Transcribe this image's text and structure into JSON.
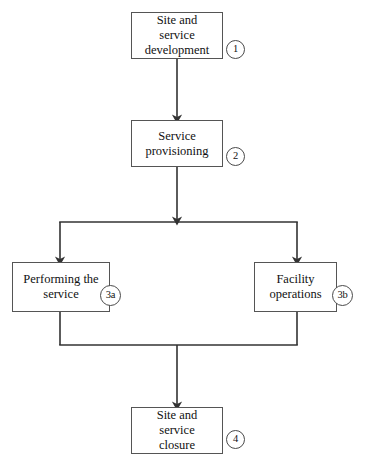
{
  "diagram": {
    "background_color": "#ffffff",
    "line_color": "#333333",
    "box_border_color": "#555555",
    "nodes": [
      {
        "id": "site-and-service-development",
        "label": "Site and\nservice\ndevelopment",
        "marker": "1",
        "x": 131,
        "y": 12,
        "width": 92,
        "height": 47,
        "marker_x": 226,
        "marker_y": 40,
        "marker_size": 19
      },
      {
        "id": "service-provisioning",
        "label": "Service\nprovisioning",
        "marker": "2",
        "x": 131,
        "y": 120,
        "width": 92,
        "height": 47,
        "marker_x": 226,
        "marker_y": 147,
        "marker_size": 19
      },
      {
        "id": "performing-the-service",
        "label": "Performing the\nservice",
        "marker": "3a",
        "x": 12,
        "y": 262,
        "width": 98,
        "height": 50,
        "marker_x": 100,
        "marker_y": 285,
        "marker_size": 21
      },
      {
        "id": "facility-operations",
        "label": "Facility\noperations",
        "marker": "3b",
        "x": 254,
        "y": 262,
        "width": 83,
        "height": 50,
        "marker_x": 332,
        "marker_y": 285,
        "marker_size": 21
      },
      {
        "id": "site-and-service-closure",
        "label": "Site and\nservice\nclosure",
        "marker": "4",
        "x": 131,
        "y": 407,
        "width": 92,
        "height": 47,
        "marker_x": 226,
        "marker_y": 430,
        "marker_size": 19
      }
    ],
    "connectors": [
      {
        "id": "dev-to-provisioning",
        "type": "vertical-arrow",
        "x": 177,
        "y1": 59,
        "y2": 120
      },
      {
        "id": "provisioning-to-split",
        "type": "vertical-arrow",
        "x": 177,
        "y1": 167,
        "y2": 222
      },
      {
        "id": "split-bar",
        "type": "horizontal-line",
        "y": 222,
        "x1": 60,
        "x2": 297
      },
      {
        "id": "split-to-performing",
        "type": "vertical-arrow",
        "x": 60,
        "y1": 222,
        "y2": 262
      },
      {
        "id": "split-to-facility",
        "type": "vertical-arrow",
        "x": 297,
        "y1": 222,
        "y2": 262
      },
      {
        "id": "performing-to-merge",
        "type": "vertical-line",
        "x": 60,
        "y1": 312,
        "y2": 345
      },
      {
        "id": "facility-to-merge",
        "type": "vertical-line",
        "x": 297,
        "y1": 312,
        "y2": 345
      },
      {
        "id": "merge-bar",
        "type": "horizontal-line",
        "y": 345,
        "x1": 60,
        "x2": 297
      },
      {
        "id": "merge-to-closure",
        "type": "vertical-arrow",
        "x": 177,
        "y1": 345,
        "y2": 407
      }
    ]
  }
}
